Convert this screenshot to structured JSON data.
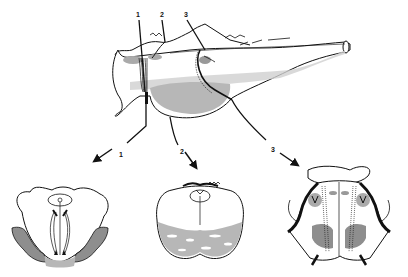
{
  "diagram": {
    "type": "anatomical-illustration",
    "colors": {
      "ink": "#111111",
      "shade": "#9a9a9a",
      "light_shade": "#c8c8c8",
      "background": "#ffffff"
    },
    "top_labels": [
      {
        "id": "top-1",
        "text": "1"
      },
      {
        "id": "top-2",
        "text": "2"
      },
      {
        "id": "top-3",
        "text": "3"
      }
    ],
    "section_labels": [
      {
        "id": "section-1",
        "text": "1"
      },
      {
        "id": "section-2",
        "text": "2"
      },
      {
        "id": "section-3",
        "text": "3"
      }
    ],
    "panels": [
      {
        "id": "lateral-view"
      },
      {
        "id": "cross-section-1"
      },
      {
        "id": "cross-section-2"
      },
      {
        "id": "cross-section-3"
      }
    ]
  }
}
